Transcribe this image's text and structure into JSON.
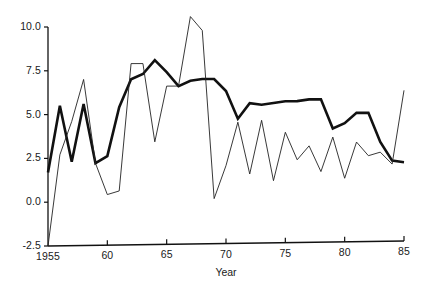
{
  "chart_data": {
    "type": "line",
    "title": "",
    "xlabel": "Year",
    "ylabel": "",
    "xlim": [
      1955,
      1985
    ],
    "ylim": [
      -2.5,
      10.0
    ],
    "grid": false,
    "legend": null,
    "x_ticks": [
      {
        "value": 1955,
        "label": "1955"
      },
      {
        "value": 1960,
        "label": "60"
      },
      {
        "value": 1965,
        "label": "65"
      },
      {
        "value": 1970,
        "label": "70"
      },
      {
        "value": 1975,
        "label": "75"
      },
      {
        "value": 1980,
        "label": "80"
      },
      {
        "value": 1985,
        "label": "85"
      }
    ],
    "y_ticks": [
      {
        "value": -2.5,
        "label": "-2.5"
      },
      {
        "value": 0.0,
        "label": "0.0"
      },
      {
        "value": 2.5,
        "label": "2.5"
      },
      {
        "value": 5.0,
        "label": "5.0"
      },
      {
        "value": 7.5,
        "label": "7.5"
      },
      {
        "value": 10.0,
        "label": "10.0"
      }
    ],
    "x": [
      1955,
      1956,
      1957,
      1958,
      1959,
      1960,
      1961,
      1962,
      1963,
      1964,
      1965,
      1966,
      1967,
      1968,
      1969,
      1970,
      1971,
      1972,
      1973,
      1974,
      1975,
      1976,
      1977,
      1978,
      1979,
      1980,
      1981,
      1982,
      1983,
      1984,
      1985
    ],
    "series": [
      {
        "name": "thick-series",
        "color": "#111111",
        "width": 2.6,
        "values": [
          1.7,
          5.5,
          2.3,
          5.6,
          2.2,
          2.6,
          5.4,
          7.0,
          7.3,
          8.1,
          7.4,
          6.6,
          6.9,
          7.0,
          7.0,
          6.3,
          4.7,
          5.6,
          5.5,
          5.6,
          5.7,
          5.7,
          5.8,
          5.8,
          4.1,
          4.4,
          5.0,
          5.0,
          3.3,
          2.2,
          2.1
        ]
      },
      {
        "name": "thin-series",
        "color": "#222222",
        "width": 0.9,
        "values": [
          -2.5,
          2.7,
          4.6,
          7.0,
          2.2,
          0.4,
          0.6,
          7.9,
          7.9,
          3.4,
          6.6,
          6.6,
          10.6,
          9.8,
          0.1,
          2.0,
          4.5,
          1.5,
          4.6,
          1.1,
          3.9,
          2.3,
          3.1,
          1.6,
          3.6,
          1.2,
          3.3,
          2.5,
          2.7,
          2.0,
          6.3
        ]
      }
    ]
  },
  "axes": {
    "geometry": {
      "left_px": 48,
      "right_px": 404,
      "top_px": 27,
      "bottom_px": 246,
      "skew_px": 5
    }
  }
}
